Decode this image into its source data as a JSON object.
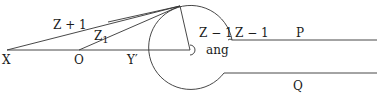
{
  "diagram": {
    "labels": {
      "x": "X",
      "o": "O",
      "y_prime": "Y′",
      "z_plus_1": "Z + 1",
      "z_1": "Z",
      "z_1_sub": "1",
      "z_minus_1_a": "Z − 1",
      "z_minus_1_b": "Z − 1",
      "ang": "ang",
      "p": "P",
      "q": "Q"
    },
    "colors": {
      "line": "#333333",
      "text": "#1a1a1a",
      "background": "#ffffff"
    }
  }
}
